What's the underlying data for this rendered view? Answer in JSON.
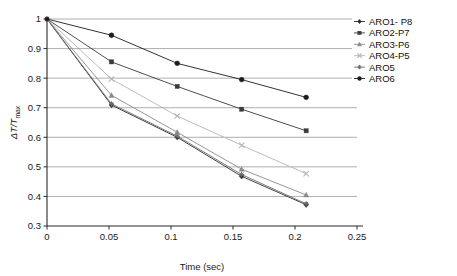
{
  "chart_data": {
    "type": "line",
    "title": "",
    "xlabel": "Time (sec)",
    "ylabel": "ΔT/Tmax",
    "ylabel_main": "ΔT/T",
    "ylabel_sub": "max",
    "xlim": [
      0,
      0.25
    ],
    "ylim": [
      0.3,
      1.0
    ],
    "xticks": [
      0,
      0.05,
      0.1,
      0.15,
      0.2,
      0.25
    ],
    "xtick_labels": [
      "0",
      "0.05",
      "0.1",
      "0.15",
      "0.2",
      "0.25"
    ],
    "yticks": [
      0.3,
      0.4,
      0.5,
      0.6,
      0.7,
      0.8,
      0.9,
      1.0
    ],
    "ytick_labels": [
      "0.3",
      "0.4",
      "0.5",
      "0.6",
      "0.7",
      "0.8",
      "0.9",
      "1"
    ],
    "grid": "horizontal",
    "legend_position": "top-right",
    "x": [
      0,
      0.052,
      0.105,
      0.157,
      0.209
    ],
    "series": [
      {
        "name": "ARO1- P8",
        "marker": "diamond",
        "color": "#2b2b2b",
        "values": [
          1,
          0.709,
          0.6,
          0.468,
          0.372
        ]
      },
      {
        "name": "ARO2-P7",
        "marker": "square",
        "color": "#3a3a3a",
        "values": [
          1,
          0.855,
          0.772,
          0.695,
          0.622
        ]
      },
      {
        "name": "ARO3-P6",
        "marker": "triangle",
        "color": "#8a8a8a",
        "values": [
          1,
          0.742,
          0.617,
          0.492,
          0.405
        ]
      },
      {
        "name": "ARO4-P5",
        "marker": "cross",
        "color": "#b4b4b4",
        "values": [
          1,
          0.797,
          0.672,
          0.573,
          0.477
        ]
      },
      {
        "name": "ARO5",
        "marker": "star",
        "color": "#6e6e6e",
        "values": [
          1,
          0.713,
          0.604,
          0.474,
          0.375
        ]
      },
      {
        "name": "ARO6",
        "marker": "circle",
        "color": "#1c1c1c",
        "values": [
          1,
          0.945,
          0.85,
          0.795,
          0.735
        ]
      }
    ]
  },
  "colors": {
    "axis": "#2b2b2b",
    "grid": "#9a9a9a",
    "background": "#ffffff",
    "text": "#111111"
  }
}
